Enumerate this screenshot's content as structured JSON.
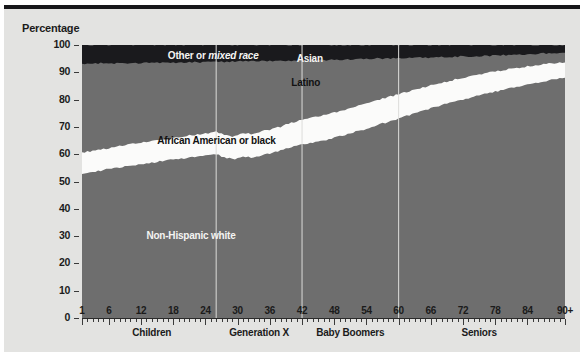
{
  "axis_title": "Percentage",
  "chart_data": {
    "type": "area",
    "title": "Percentage",
    "subtitle": "",
    "xlabel": "",
    "ylabel": "Percentage",
    "stacked": true,
    "stacked_order": "bottom-to-top",
    "grid": false,
    "legend_position": "in-plot",
    "xlim": [
      1,
      91
    ],
    "ylim": [
      0,
      100
    ],
    "y_ticks": [
      0,
      10,
      20,
      30,
      40,
      50,
      60,
      70,
      80,
      90,
      100
    ],
    "x_ticks": [
      1,
      6,
      12,
      18,
      24,
      30,
      36,
      42,
      48,
      54,
      60,
      66,
      72,
      78,
      84,
      91
    ],
    "x_tick_labels": [
      "1",
      "6",
      "12",
      "18",
      "24",
      "30",
      "36",
      "42",
      "48",
      "54",
      "60",
      "66",
      "72",
      "78",
      "84",
      "90+"
    ],
    "x_minor_tick_step": 1,
    "annotations": [
      {
        "label": "Other or mixed race",
        "x": 17,
        "y": 96,
        "style": "on-dark",
        "italic_part": "mixed race"
      },
      {
        "label": "Asian",
        "x": 41,
        "y": 95,
        "style": "on-dark"
      },
      {
        "label": "Latino",
        "x": 40,
        "y": 86,
        "style": "on-gray-dark"
      },
      {
        "label": "African American or black",
        "x": 15,
        "y": 65,
        "style": "on-white"
      },
      {
        "label": "Non-Hispanic white",
        "x": 13,
        "y": 30,
        "style": "on-gray-light"
      }
    ],
    "generation_dividers": [
      {
        "x": 26,
        "label": "Children"
      },
      {
        "x": 42,
        "label": "Generation X"
      },
      {
        "x": 60,
        "label": "Baby Boomers"
      }
    ],
    "generations": [
      {
        "label": "Children",
        "x_start": 1,
        "x_end": 26,
        "center_x": 14
      },
      {
        "label": "Generation X",
        "x_start": 26,
        "x_end": 42,
        "center_x": 34
      },
      {
        "label": "Baby Boomers",
        "x_start": 42,
        "x_end": 60,
        "center_x": 51
      },
      {
        "label": "Seniors",
        "x_start": 60,
        "x_end": 91,
        "center_x": 75
      }
    ],
    "colors": {
      "non_hispanic_white": "#6e6e6e",
      "african_american": "#fbfbfa",
      "latino": "#6e6e6e",
      "asian": "#1a1a1d",
      "other_mixed": "#1a1a1d",
      "background": "#e3e3e1",
      "axis": "#2a2a2a"
    },
    "x": [
      1,
      3,
      5,
      7,
      9,
      11,
      13,
      15,
      17,
      19,
      21,
      23,
      25,
      26,
      27,
      28,
      29,
      30,
      31,
      32,
      33,
      34,
      35,
      36,
      37,
      38,
      39,
      40,
      41,
      42,
      44,
      46,
      48,
      50,
      52,
      54,
      56,
      58,
      60,
      62,
      64,
      66,
      68,
      70,
      72,
      74,
      76,
      78,
      80,
      82,
      84,
      86,
      88,
      91
    ],
    "series": [
      {
        "name": "Non-Hispanic white",
        "cumulative_top": [
          53.0,
          53.6,
          54.2,
          54.9,
          55.4,
          56.0,
          56.6,
          57.2,
          57.8,
          58.3,
          58.8,
          59.4,
          59.8,
          60.2,
          59.2,
          58.6,
          58.2,
          58.4,
          59.1,
          59.0,
          58.6,
          59.4,
          60.1,
          60.3,
          60.8,
          61.3,
          62.0,
          62.6,
          63.1,
          63.6,
          64.3,
          65.0,
          66.0,
          67.0,
          68.2,
          69.1,
          70.6,
          71.8,
          73.0,
          74.3,
          75.6,
          76.8,
          78.0,
          79.0,
          80.0,
          81.0,
          82.0,
          82.9,
          83.8,
          84.6,
          85.4,
          86.2,
          87.0,
          88.0
        ]
      },
      {
        "name": "African American or black",
        "cumulative_top": [
          60.6,
          61.2,
          61.9,
          62.6,
          63.3,
          63.9,
          64.5,
          65.1,
          65.7,
          66.3,
          66.8,
          67.3,
          67.8,
          68.2,
          67.4,
          66.8,
          66.6,
          67.0,
          67.6,
          67.6,
          67.2,
          68.0,
          68.7,
          69.0,
          69.6,
          70.1,
          70.8,
          71.5,
          72.0,
          72.6,
          73.4,
          74.2,
          75.2,
          76.3,
          77.5,
          78.4,
          79.8,
          80.9,
          82.0,
          83.1,
          84.2,
          85.2,
          86.2,
          87.1,
          88.0,
          88.8,
          89.6,
          90.3,
          91.0,
          91.6,
          92.2,
          92.7,
          93.1,
          93.6
        ]
      },
      {
        "name": "Latino",
        "cumulative_top": [
          93.2,
          93.2,
          93.3,
          93.3,
          93.4,
          93.4,
          93.5,
          93.5,
          93.6,
          93.6,
          93.7,
          93.7,
          93.8,
          93.8,
          93.8,
          93.9,
          93.9,
          94.0,
          94.0,
          94.0,
          94.1,
          94.1,
          94.2,
          94.2,
          94.2,
          94.3,
          94.3,
          94.3,
          94.4,
          94.4,
          94.5,
          94.5,
          94.6,
          94.7,
          94.8,
          94.9,
          95.0,
          95.1,
          95.2,
          95.3,
          95.4,
          95.5,
          95.6,
          95.7,
          95.8,
          95.9,
          96.0,
          96.1,
          96.3,
          96.5,
          96.6,
          96.8,
          97.0,
          97.2
        ]
      },
      {
        "name": "Asian",
        "cumulative_top": [
          100,
          100,
          100,
          100,
          100,
          100,
          100,
          100,
          100,
          100,
          100,
          100,
          100,
          100,
          100,
          100,
          100,
          100,
          100,
          100,
          100,
          100,
          100,
          100,
          100,
          100,
          100,
          100,
          100,
          100,
          100,
          100,
          100,
          100,
          100,
          100,
          100,
          100,
          100,
          100,
          100,
          100,
          100,
          100,
          100,
          100,
          100,
          100,
          100,
          100,
          100,
          100,
          100,
          100
        ]
      }
    ]
  },
  "caption": ""
}
